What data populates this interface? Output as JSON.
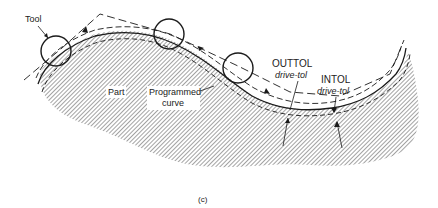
{
  "diagram": {
    "labels": {
      "tool": "Tool",
      "part": "Part",
      "programmed_line1": "Programmed",
      "programmed_line2": "curve",
      "outtol": "OUTTOL",
      "outtol_sub": "drive-tol",
      "intol": "INTOL",
      "intol_sub": "drive-tol",
      "caption": "(c)"
    },
    "colors": {
      "ink": "#1a1a1a",
      "hatch": "#555555",
      "background": "#ffffff"
    },
    "tools": [
      {
        "cx": 56,
        "cy": 51,
        "r": 15
      },
      {
        "cx": 169,
        "cy": 34,
        "r": 15
      },
      {
        "cx": 238,
        "cy": 68,
        "r": 15
      }
    ]
  }
}
